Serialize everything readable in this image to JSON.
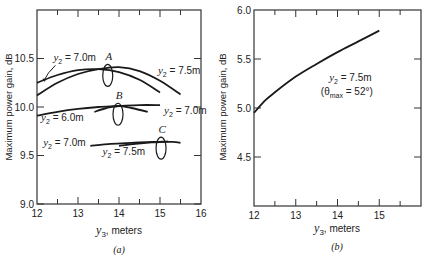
{
  "chart_data": [
    {
      "panel": "(a)",
      "type": "line",
      "xlabel_var": "y",
      "xlabel_sub": "3",
      "xlabel_unit": ", meters",
      "ylabel": "Maximum power gain, dB",
      "xlim": [
        12,
        16
      ],
      "ylim": [
        9.0,
        11.0
      ],
      "xticks": [
        12,
        13,
        14,
        15,
        16
      ],
      "xtick_labels": [
        "12",
        "13",
        "14",
        "15",
        "16"
      ],
      "yticks": [
        9.0,
        9.5,
        10.0,
        10.5
      ],
      "ytick_labels": [
        "9.0",
        "9.5",
        "10.0",
        "10.5"
      ],
      "grid": false,
      "series": [
        {
          "group": "A",
          "name": "y2 = 7.0m",
          "x": [
            12.0,
            12.5,
            13.0,
            13.5,
            14.0,
            14.5,
            15.0
          ],
          "values": [
            10.25,
            10.33,
            10.38,
            10.39,
            10.36,
            10.28,
            10.15
          ]
        },
        {
          "group": "A",
          "name": "y2 = 7.5m",
          "x": [
            12.0,
            12.5,
            13.0,
            13.5,
            14.0,
            14.5,
            15.0,
            15.5
          ],
          "values": [
            10.12,
            10.25,
            10.34,
            10.39,
            10.41,
            10.37,
            10.27,
            10.13
          ]
        },
        {
          "group": "B",
          "name": "y2 = 6.0m",
          "x": [
            12.0,
            12.5,
            13.0,
            13.5,
            14.0,
            14.5,
            15.0
          ],
          "values": [
            9.91,
            9.95,
            9.98,
            10.0,
            10.01,
            10.02,
            10.02
          ]
        },
        {
          "group": "B",
          "name": "y2 = 7.0m",
          "x": [
            13.4,
            13.7,
            14.0,
            14.3,
            14.7
          ],
          "values": [
            9.95,
            9.99,
            10.01,
            9.99,
            9.95
          ]
        },
        {
          "group": "C",
          "name": "y2 = 7.0m",
          "x": [
            13.3,
            13.8,
            14.3,
            14.8,
            15.3,
            15.5
          ],
          "values": [
            9.6,
            9.62,
            9.63,
            9.64,
            9.64,
            9.63
          ]
        },
        {
          "group": "C",
          "name": "y2 = 7.5m",
          "x": [
            14.0,
            14.4,
            14.8,
            15.2
          ],
          "values": [
            9.6,
            9.62,
            9.635,
            9.645
          ]
        }
      ],
      "annotations": [
        {
          "text": "A",
          "x": 13.75,
          "y": 10.48
        },
        {
          "text": "B",
          "x": 14.0,
          "y": 10.08
        },
        {
          "text": "C",
          "x": 15.05,
          "y": 9.73
        },
        {
          "label_var": "y",
          "label_sub": "2",
          "label_val": " = 7.0m",
          "x": 12.4,
          "y": 10.47
        },
        {
          "label_var": "y",
          "label_sub": "2",
          "label_val": " = 7.5m",
          "x": 14.95,
          "y": 10.34
        },
        {
          "label_var": "y",
          "label_sub": "2",
          "label_val": " = 6.0m",
          "x": 12.1,
          "y": 9.86
        },
        {
          "label_var": "y",
          "label_sub": "2",
          "label_val": " = 7.0m",
          "x": 15.1,
          "y": 9.93
        },
        {
          "label_var": "y",
          "label_sub": "2",
          "label_val": " = 7.0m",
          "x": 12.15,
          "y": 9.6
        },
        {
          "label_var": "y",
          "label_sub": "2",
          "label_val": " = 7.5m",
          "x": 13.6,
          "y": 9.51
        }
      ]
    },
    {
      "panel": "(b)",
      "type": "line",
      "xlabel_var": "y",
      "xlabel_sub": "3",
      "xlabel_unit": ", meters",
      "ylabel": "Maximum power gain, dB",
      "xlim": [
        12,
        16
      ],
      "ylim": [
        4.0,
        6.0
      ],
      "xticks": [
        12,
        13,
        14,
        15
      ],
      "xtick_labels": [
        "12",
        "13",
        "14",
        "15"
      ],
      "yticks": [
        4.5,
        5.0,
        5.5,
        6.0
      ],
      "ytick_labels": [
        "4.5",
        "5.0",
        "5.5",
        "6.0"
      ],
      "grid": false,
      "series": [
        {
          "name": "y2 = 7.5m (θmax = 52°)",
          "x": [
            12.0,
            12.25,
            12.5,
            13.0,
            13.5,
            14.0,
            14.5,
            15.0
          ],
          "values": [
            4.95,
            5.07,
            5.16,
            5.32,
            5.45,
            5.57,
            5.68,
            5.79
          ]
        }
      ],
      "annotations": [
        {
          "label_var": "y",
          "label_sub": "2",
          "label_val": " = 7.5m",
          "x": 13.8,
          "y": 5.28
        },
        {
          "text_theta": "(θ",
          "text_sub": "max",
          "text_rest": " = 52°)",
          "x": 13.6,
          "y": 5.13
        }
      ]
    }
  ]
}
